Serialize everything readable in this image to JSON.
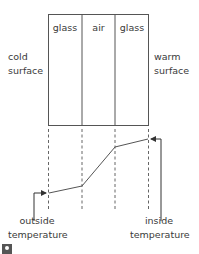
{
  "diagram": {
    "panes": [
      {
        "label": "glass"
      },
      {
        "label": "air"
      },
      {
        "label": "glass"
      }
    ],
    "left_label": {
      "line1": "cold",
      "line2": "surface"
    },
    "right_label": {
      "line1": "warm",
      "line2": "surface"
    },
    "bottom_left_label": {
      "line1": "outside",
      "line2": "temperature"
    },
    "bottom_right_label": {
      "line1": "inside",
      "line2": "temperature"
    },
    "temperature_profile": {
      "boundaries_x": [
        48,
        82,
        115,
        149
      ],
      "points_y": [
        193,
        186,
        147,
        139
      ]
    },
    "colors": {
      "lines": "#555555",
      "text": "#3a3a3a"
    },
    "icon": "image-badge-icon"
  }
}
